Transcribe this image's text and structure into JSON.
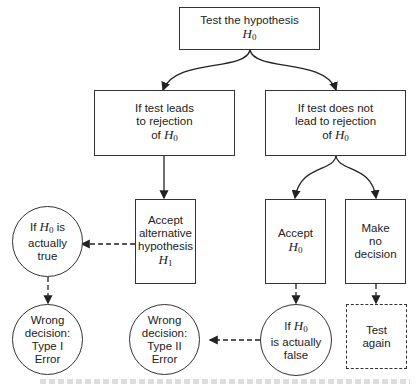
{
  "diagram": {
    "type": "flowchart",
    "nodes": {
      "test": {
        "lines": [
          "Test the hypothesis"
        ],
        "math": "H",
        "sub": "0"
      },
      "reject": {
        "text": "If test leads\nto rejection\nof ",
        "math": "H",
        "sub": "0"
      },
      "not_reject": {
        "text": "If test does not\nlead to rejection\nof ",
        "math": "H",
        "sub": "0"
      },
      "accept_alt": {
        "text": "Accept\nalternative\nhypothesis",
        "math": "H",
        "sub": "1"
      },
      "accept_h0": {
        "text": "Accept",
        "math": "H",
        "sub": "0"
      },
      "no_decision": {
        "text": "Make\nno\ndecision"
      },
      "h0_true": {
        "pre": "If ",
        "math": "H",
        "sub": "0",
        "post": " is\nactually\ntrue"
      },
      "type1": {
        "text": "Wrong\ndecision:\nType I\nError"
      },
      "type2": {
        "text": "Wrong\ndecision:\nType II\nError"
      },
      "h0_false": {
        "pre": "If ",
        "math": "H",
        "sub": "0",
        "post": "\nis actually\nfalse"
      },
      "test_again": {
        "text": "Test\nagain"
      }
    },
    "edges": [
      {
        "from": "test",
        "to": "reject",
        "style": "solid-curved"
      },
      {
        "from": "test",
        "to": "not_reject",
        "style": "solid-curved"
      },
      {
        "from": "reject",
        "to": "accept_alt",
        "style": "solid"
      },
      {
        "from": "not_reject",
        "to": "accept_h0",
        "style": "solid-curved"
      },
      {
        "from": "not_reject",
        "to": "no_decision",
        "style": "solid-curved"
      },
      {
        "from": "accept_alt",
        "to": "h0_true",
        "style": "dashed"
      },
      {
        "from": "h0_true",
        "to": "type1",
        "style": "dashed"
      },
      {
        "from": "accept_h0",
        "to": "h0_false",
        "style": "dashed"
      },
      {
        "from": "h0_false",
        "to": "type2",
        "style": "dashed"
      },
      {
        "from": "no_decision",
        "to": "test_again",
        "style": "dashed"
      }
    ]
  }
}
